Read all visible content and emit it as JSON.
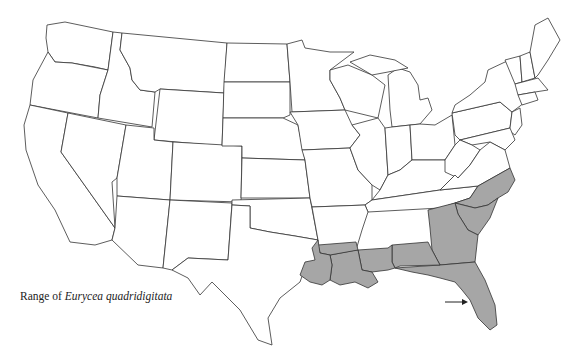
{
  "caption": {
    "prefix": "Range of ",
    "species": "Eurycea quadridigitata"
  },
  "map": {
    "region": "Contiguous United States",
    "range_fill_color": "#a6a6a6",
    "outline_color": "#333333",
    "range_states": [
      "Texas (east)",
      "Arkansas (south)",
      "Louisiana",
      "Mississippi (south)",
      "Alabama (south)",
      "Georgia",
      "Florida",
      "South Carolina",
      "North Carolina"
    ],
    "arrow_annotation": "arrow pointing to Florida Gulf coast"
  }
}
